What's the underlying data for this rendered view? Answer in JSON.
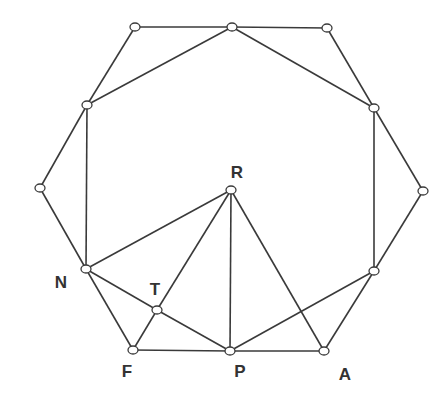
{
  "diagram": {
    "type": "graph",
    "colors": {
      "line": "#3a3a3a",
      "node_fill": "#ffffff",
      "label": "#333333"
    },
    "nodes": [
      {
        "id": "v1",
        "x": 135,
        "y": 27,
        "label": ""
      },
      {
        "id": "v2",
        "x": 232,
        "y": 27,
        "label": ""
      },
      {
        "id": "v3",
        "x": 327,
        "y": 28,
        "label": ""
      },
      {
        "id": "v4",
        "x": 87,
        "y": 105,
        "label": ""
      },
      {
        "id": "v5",
        "x": 374,
        "y": 108,
        "label": ""
      },
      {
        "id": "v6",
        "x": 40,
        "y": 188,
        "label": ""
      },
      {
        "id": "v7",
        "x": 423,
        "y": 191,
        "label": ""
      },
      {
        "id": "R",
        "x": 231,
        "y": 190,
        "label": "R"
      },
      {
        "id": "N",
        "x": 86,
        "y": 269,
        "label": "N"
      },
      {
        "id": "v8",
        "x": 374,
        "y": 271,
        "label": ""
      },
      {
        "id": "T",
        "x": 157,
        "y": 310,
        "label": "T"
      },
      {
        "id": "F",
        "x": 133,
        "y": 350,
        "label": "F"
      },
      {
        "id": "P",
        "x": 230,
        "y": 351,
        "label": "P"
      },
      {
        "id": "A",
        "x": 324,
        "y": 351,
        "label": "A"
      }
    ],
    "edges": [
      [
        "v1",
        "v2"
      ],
      [
        "v2",
        "v3"
      ],
      [
        "v1",
        "v4"
      ],
      [
        "v3",
        "v5"
      ],
      [
        "v2",
        "v4"
      ],
      [
        "v2",
        "v5"
      ],
      [
        "v4",
        "v6"
      ],
      [
        "v5",
        "v7"
      ],
      [
        "v4",
        "N"
      ],
      [
        "v5",
        "v8"
      ],
      [
        "v6",
        "N"
      ],
      [
        "v7",
        "v8"
      ],
      [
        "N",
        "R"
      ],
      [
        "N",
        "F"
      ],
      [
        "N",
        "T"
      ],
      [
        "T",
        "P"
      ],
      [
        "F",
        "T"
      ],
      [
        "T",
        "R"
      ],
      [
        "R",
        "P"
      ],
      [
        "R",
        "A"
      ],
      [
        "F",
        "P"
      ],
      [
        "P",
        "A"
      ],
      [
        "P",
        "v8"
      ],
      [
        "A",
        "v8"
      ]
    ],
    "labels": [
      {
        "text": "R",
        "x": 237,
        "y": 173
      },
      {
        "text": "N",
        "x": 61,
        "y": 283
      },
      {
        "text": "T",
        "x": 155,
        "y": 290
      },
      {
        "text": "F",
        "x": 127,
        "y": 372
      },
      {
        "text": "P",
        "x": 240,
        "y": 372
      },
      {
        "text": "A",
        "x": 345,
        "y": 375
      }
    ]
  }
}
